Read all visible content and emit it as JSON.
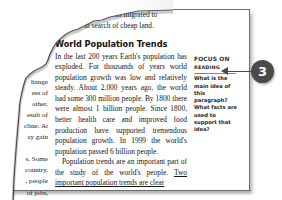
{
  "page": {
    "left_column_fragments": [
      "hange",
      "ess of",
      "other.",
      "esult of",
      "cline. At",
      "ay gain",
      "s. Some",
      "country,",
      ", people",
      "of jobs,",
      "ommon"
    ],
    "top_partial_lines": [
      "of British citizens migrated to",
      "Australia in search of cheap land."
    ],
    "section_heading": "World Population Trends",
    "paragraph_1": "In the last 200 years Earth's population has exploded. For thousands of years world population growth was low and relatively steady. About 2,000 years ago, the world had some 300 million people. By 1800 there were almost 1 billion people. Since 1800, better health care and improved food production have supported tremendous population growth. In 1999 the world's population passed 6 billion people.",
    "paragraph_2_lead": "Population trends are an important part of the study of the world's people. ",
    "paragraph_2_underlined": "Two important population trends are clear"
  },
  "sidebar": {
    "heading_line_1": "Focus on",
    "heading_line_2": "Reading",
    "question": "What is the main idea of this paragraph? What facts are used to support that idea?"
  },
  "callout": {
    "number": "3"
  },
  "colors": {
    "text": "#161616",
    "frame": "#6d6d6d",
    "badge": "#4a4a4a",
    "sidebar_heading": "#2e2e2e"
  }
}
